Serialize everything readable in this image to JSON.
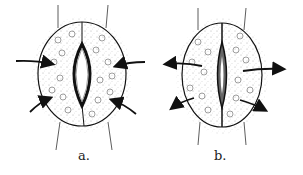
{
  "figure": {
    "panels": [
      {
        "id": "a",
        "label": "a.",
        "state": "open stoma",
        "arrows": "inward"
      },
      {
        "id": "b",
        "label": "b.",
        "state": "closed stoma",
        "arrows": "outward"
      }
    ]
  }
}
